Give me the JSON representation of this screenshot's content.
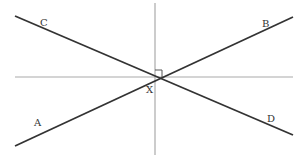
{
  "diagram": {
    "type": "intersecting-lines",
    "labels": {
      "A": "A",
      "B": "B",
      "C": "C",
      "D": "D",
      "X": "X"
    },
    "colors": {
      "main_line": "#333333",
      "axis_line": "#aaaaaa",
      "label": "#333333"
    },
    "right_angle_marker": true
  }
}
